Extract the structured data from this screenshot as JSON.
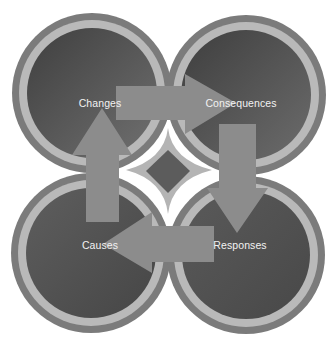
{
  "diagram": {
    "type": "cycle",
    "nodes": [
      {
        "id": "changes",
        "label": "Changes",
        "cx": 92,
        "cy": 93,
        "label_x": 100,
        "label_y": 103
      },
      {
        "id": "consequences",
        "label": "Consequences",
        "cx": 246,
        "cy": 95,
        "label_x": 241,
        "label_y": 103
      },
      {
        "id": "causes",
        "label": "Causes",
        "cx": 91,
        "cy": 253,
        "label_x": 100,
        "label_y": 245
      },
      {
        "id": "responses",
        "label": "Responses",
        "cx": 246,
        "cy": 255,
        "label_x": 240,
        "label_y": 245
      }
    ],
    "edges": [
      {
        "from": "causes",
        "to": "changes",
        "direction": "up"
      },
      {
        "from": "changes",
        "to": "consequences",
        "direction": "right"
      },
      {
        "from": "consequences",
        "to": "responses",
        "direction": "down"
      },
      {
        "from": "responses",
        "to": "causes",
        "direction": "left"
      }
    ],
    "colors": {
      "outer_band": "#7b7b7b",
      "light_ring": "#b9b9b9",
      "fill_dark": "#474747",
      "fill_light": "#6e6e6e",
      "arrow": "#8c8c8c",
      "label": "#f2f2f2"
    }
  }
}
